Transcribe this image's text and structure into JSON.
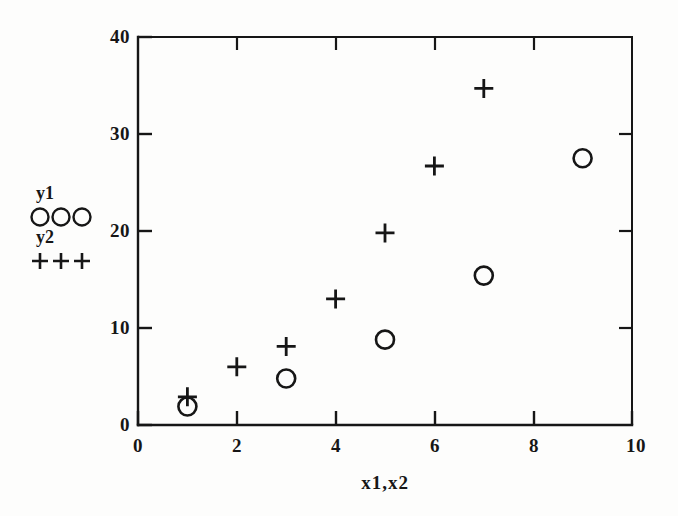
{
  "figure": {
    "background_color": "#fdfdfc",
    "ink_color": "#161616"
  },
  "axis": {
    "x_title": "x1,x2",
    "y_title": "",
    "x_ticks": [
      "0",
      "2",
      "4",
      "6",
      "8",
      "10"
    ],
    "y_ticks": [
      "0",
      "10",
      "20",
      "30",
      "40"
    ]
  },
  "legend": {
    "entries": [
      {
        "label": "y1",
        "marker": "circle-marker",
        "count": 3
      },
      {
        "label": "y2",
        "marker": "plus-marker",
        "count": 3
      }
    ]
  },
  "chart_data": {
    "type": "scatter",
    "title": "",
    "xlabel": "x1,x2",
    "ylabel": "",
    "xlim": [
      0,
      10
    ],
    "ylim": [
      0,
      40
    ],
    "xticks": [
      0,
      2,
      4,
      6,
      8,
      10
    ],
    "yticks": [
      0,
      10,
      20,
      30,
      40
    ],
    "grid": false,
    "legend_position": "outside-left",
    "tick_direction": "in",
    "frame": "box-open-right-partial",
    "series": [
      {
        "name": "y1",
        "marker": "circle",
        "x": [
          1,
          3,
          5,
          7,
          9
        ],
        "y": [
          1.9,
          4.8,
          8.8,
          15.4,
          27.5
        ]
      },
      {
        "name": "y2",
        "marker": "plus",
        "x": [
          1,
          2,
          3,
          4,
          5,
          6,
          7
        ],
        "y": [
          2.9,
          6.0,
          8.1,
          13.0,
          19.8,
          26.7,
          34.7
        ]
      }
    ]
  }
}
